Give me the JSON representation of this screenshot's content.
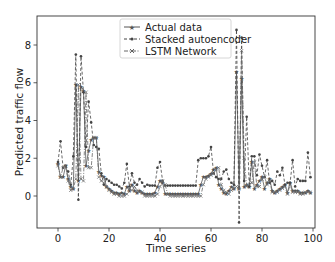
{
  "chart_data": {
    "type": "line",
    "title": "",
    "xlabel": "Time series",
    "ylabel": "Predicted traffic flow",
    "xlim": [
      -8,
      101
    ],
    "ylim": [
      -1.75,
      9.3
    ],
    "xticks": [
      0,
      20,
      40,
      60,
      80,
      100
    ],
    "yticks": [
      0,
      2,
      4,
      6,
      8
    ],
    "grid": false,
    "legend_position": "upper center",
    "x": [
      0,
      1,
      2,
      3,
      4,
      5,
      6,
      7,
      8,
      9,
      10,
      11,
      12,
      13,
      14,
      15,
      16,
      17,
      18,
      19,
      20,
      21,
      22,
      23,
      24,
      25,
      26,
      27,
      28,
      29,
      30,
      31,
      32,
      33,
      34,
      35,
      36,
      37,
      38,
      39,
      40,
      41,
      42,
      43,
      44,
      45,
      46,
      47,
      48,
      49,
      50,
      51,
      52,
      53,
      54,
      55,
      56,
      57,
      58,
      59,
      60,
      61,
      62,
      63,
      64,
      65,
      66,
      67,
      68,
      69,
      70,
      71,
      72,
      73,
      74,
      75,
      76,
      77,
      78,
      79,
      80,
      81,
      82,
      83,
      84,
      85,
      86,
      87,
      88,
      89,
      90,
      91,
      92,
      93,
      94,
      95,
      96,
      97,
      98,
      99
    ],
    "series": [
      {
        "name": "Actual data",
        "style": "solid",
        "marker": "star",
        "color": "#555555",
        "values": [
          1.7,
          1.0,
          1.0,
          1.6,
          0.9,
          0.5,
          0.4,
          5.9,
          0.8,
          5.8,
          5.6,
          1.6,
          2.4,
          3.0,
          3.1,
          3.1,
          1.3,
          1.1,
          1.0,
          0.5,
          0.4,
          0.3,
          0.2,
          0.2,
          0.1,
          0.2,
          0.1,
          0.5,
          0.3,
          0.6,
          0.3,
          0.2,
          0.3,
          0.2,
          0.1,
          0.1,
          0.1,
          0.1,
          0.2,
          0.5,
          0.8,
          0.7,
          0.1,
          0.1,
          0.1,
          0.1,
          0.1,
          0.1,
          0.1,
          0.1,
          0.1,
          0.1,
          0.1,
          0.1,
          0.1,
          0.1,
          0.6,
          1.0,
          1.0,
          1.1,
          1.2,
          1.4,
          1.5,
          0.6,
          0.4,
          0.2,
          0.1,
          0.3,
          0.5,
          0.4,
          6.6,
          0.4,
          6.2,
          0.5,
          0.6,
          0.5,
          1.8,
          0.4,
          0.6,
          0.8,
          1.0,
          0.4,
          0.7,
          0.9,
          0.3,
          0.2,
          0.3,
          0.4,
          0.5,
          0.6,
          0.2,
          0.7,
          0.3,
          0.3,
          0.3,
          0.2,
          0.2,
          0.2,
          0.3,
          0.2
        ]
      },
      {
        "name": "Stacked autoencoder",
        "style": "dashed",
        "marker": "dot",
        "color": "#444444",
        "values": [
          1.8,
          2.9,
          1.5,
          1.6,
          1.3,
          0.6,
          2.1,
          7.5,
          -0.2,
          7.4,
          5.5,
          2.6,
          5.0,
          3.9,
          2.7,
          2.6,
          2.5,
          1.2,
          0.6,
          0.9,
          0.8,
          0.7,
          0.6,
          0.6,
          0.5,
          0.4,
          0.7,
          1.7,
          0.5,
          1.2,
          0.7,
          0.6,
          0.9,
          0.7,
          0.5,
          0.6,
          0.55,
          0.55,
          0.55,
          1.5,
          1.8,
          0.8,
          0.55,
          0.55,
          0.55,
          0.55,
          0.55,
          0.55,
          0.55,
          0.55,
          0.55,
          0.55,
          0.55,
          0.55,
          0.55,
          1.9,
          2.0,
          2.0,
          2.0,
          2.1,
          2.6,
          1.2,
          1.0,
          0.9,
          0.9,
          1.3,
          1.4,
          0.9,
          0.7,
          0.6,
          8.8,
          -1.4,
          8.4,
          0.8,
          4.2,
          0.5,
          2.1,
          2.1,
          1.1,
          2.2,
          1.6,
          1.0,
          1.9,
          0.7,
          0.8,
          0.6,
          1.3,
          1.1,
          1.5,
          0.6,
          0.7,
          0.7,
          1.9,
          0.5,
          0.9,
          0.8,
          0.8,
          0.8,
          2.3,
          1.0
        ]
      },
      {
        "name": "LSTM Network",
        "style": "dashdot",
        "marker": "x",
        "color": "#666666",
        "values": [
          1.6,
          1.0,
          1.5,
          1.6,
          0.8,
          0.3,
          0.4,
          0.9,
          5.9,
          0.9,
          0.8,
          5.5,
          1.5,
          1.5,
          3.1,
          3.1,
          1.0,
          0.8,
          0.7,
          0.5,
          0.3,
          0.2,
          0.1,
          0.1,
          0.0,
          0.0,
          0.0,
          0.1,
          0.4,
          0.3,
          0.5,
          0.3,
          0.2,
          0.2,
          0.0,
          0.0,
          0.0,
          0.0,
          0.0,
          0.1,
          0.5,
          0.8,
          0.6,
          0.1,
          0.0,
          0.0,
          0.0,
          0.0,
          0.0,
          0.0,
          0.0,
          0.0,
          0.0,
          0.0,
          0.0,
          0.0,
          0.0,
          0.6,
          0.9,
          1.0,
          1.1,
          1.2,
          1.4,
          1.5,
          0.6,
          0.3,
          0.2,
          0.1,
          0.3,
          0.4,
          0.5,
          0.4,
          7.7,
          2.0,
          0.5,
          0.6,
          0.7,
          1.8,
          0.5,
          0.5,
          0.9,
          1.0,
          0.6,
          0.8,
          0.2,
          0.2,
          0.2,
          0.3,
          0.4,
          0.5,
          0.1,
          0.6,
          0.2,
          0.2,
          0.2,
          0.1,
          0.1,
          0.2,
          0.2,
          0.2
        ]
      }
    ]
  },
  "layout": {
    "plot_left": 37,
    "plot_top": 16,
    "plot_right": 315,
    "plot_bottom": 228,
    "x0_px": 58,
    "x100_px": 313,
    "y0_px": 196,
    "y8_px": 45
  },
  "legend": {
    "items": [
      {
        "label": "Actual data"
      },
      {
        "label": "Stacked autoencoder"
      },
      {
        "label": "LSTM Network"
      }
    ]
  },
  "axes": {
    "xlabel": "Time series",
    "ylabel": "Predicted traffic flow"
  }
}
